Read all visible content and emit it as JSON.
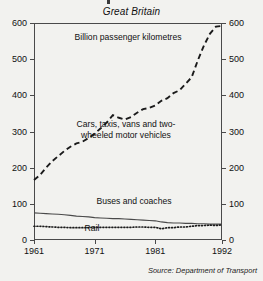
{
  "figure": {
    "subtitle": "Great Britain",
    "source": "Source: Department of Transport"
  },
  "annotations": {
    "units": "Billion passenger kilometres",
    "cars": "Cars, taxis, vans and two-wheeled motor vehicles",
    "buses": "Buses and coaches",
    "rail": "Rail"
  },
  "axes": {
    "y_ticks": [
      "0",
      "100",
      "200",
      "300",
      "400",
      "500",
      "600"
    ],
    "x_ticks": [
      "1961",
      "1971",
      "1981",
      "1992"
    ]
  },
  "chart_data": {
    "type": "line",
    "title": "Great Britain",
    "subtitle": "Great Britain",
    "xlabel": "",
    "ylabel": "Billion passenger kilometres",
    "xlim": [
      1961,
      1992
    ],
    "ylim": [
      0,
      600
    ],
    "ytick_values": [
      0,
      100,
      200,
      300,
      400,
      500,
      600
    ],
    "xtick_values": [
      1961,
      1971,
      1981,
      1992
    ],
    "grid": false,
    "legend": "inline-annotations",
    "source": "Source: Department of Transport",
    "x": [
      1961,
      1962,
      1963,
      1964,
      1965,
      1966,
      1967,
      1968,
      1969,
      1970,
      1971,
      1972,
      1973,
      1974,
      1975,
      1976,
      1977,
      1978,
      1979,
      1980,
      1981,
      1982,
      1983,
      1984,
      1985,
      1986,
      1987,
      1988,
      1989,
      1990,
      1991,
      1992
    ],
    "series": [
      {
        "name": "Cars, taxis, vans and two-wheeled motor vehicles",
        "style": "dashed",
        "values": [
          166,
          180,
          200,
          218,
          232,
          246,
          258,
          267,
          272,
          282,
          294,
          309,
          325,
          345,
          338,
          333,
          340,
          352,
          362,
          365,
          372,
          385,
          392,
          406,
          414,
          432,
          450,
          496,
          537,
          570,
          590,
          592
        ]
      },
      {
        "name": "Buses and coaches",
        "style": "solid",
        "values": [
          75,
          74,
          73,
          72,
          71,
          70,
          68,
          66,
          65,
          64,
          62,
          61,
          60,
          59,
          59,
          58,
          57,
          56,
          55,
          54,
          53,
          50,
          48,
          47,
          47,
          46,
          46,
          45,
          45,
          44,
          44,
          44
        ]
      },
      {
        "name": "Rail",
        "style": "dotted",
        "values": [
          38,
          38,
          37,
          36,
          35,
          35,
          34,
          34,
          34,
          34,
          35,
          35,
          35,
          35,
          35,
          35,
          35,
          36,
          36,
          35,
          35,
          31,
          34,
          34,
          36,
          36,
          38,
          40,
          40,
          41,
          40,
          42
        ]
      }
    ]
  }
}
